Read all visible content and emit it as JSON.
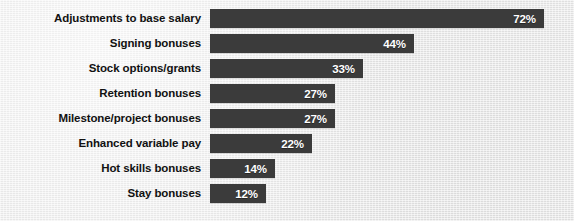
{
  "chart_data": {
    "type": "bar",
    "orientation": "horizontal",
    "title": "",
    "subtitle": "",
    "xlabel": "",
    "ylabel": "",
    "grid": false,
    "legend": null,
    "value_suffix": "%",
    "xlim": [
      0,
      72
    ],
    "axis_max_for_scale": 72,
    "categories": [
      "Adjustments to base salary",
      "Signing bonuses",
      "Stock options/grants",
      "Retention bonuses",
      "Milestone/project bonuses",
      "Enhanced variable pay",
      "Hot skills bonuses",
      "Stay bonuses"
    ],
    "values": [
      72,
      44,
      33,
      27,
      27,
      22,
      14,
      12
    ],
    "value_labels": [
      "72%",
      "44%",
      "33%",
      "27%",
      "27%",
      "22%",
      "14%",
      "12%"
    ],
    "colors": {
      "background": "#e9e9e9",
      "bar": "#3b3b3b",
      "category_label": "#111111",
      "value_label": "#ffffff"
    }
  },
  "bars": [
    {
      "label": "Adjustments to base salary",
      "value": 72,
      "value_label": "72%"
    },
    {
      "label": "Signing bonuses",
      "value": 44,
      "value_label": "44%"
    },
    {
      "label": "Stock options/grants",
      "value": 33,
      "value_label": "33%"
    },
    {
      "label": "Retention bonuses",
      "value": 27,
      "value_label": "27%"
    },
    {
      "label": "Milestone/project bonuses",
      "value": 27,
      "value_label": "27%"
    },
    {
      "label": "Enhanced variable pay",
      "value": 22,
      "value_label": "22%"
    },
    {
      "label": "Hot skills bonuses",
      "value": 14,
      "value_label": "14%"
    },
    {
      "label": "Stay bonuses",
      "value": 12,
      "value_label": "12%"
    }
  ],
  "layout": {
    "bar_origin_x": 210,
    "first_bar_y": 9,
    "bar_height": 19,
    "row_pitch": 25,
    "px_per_unit": 4.64
  }
}
